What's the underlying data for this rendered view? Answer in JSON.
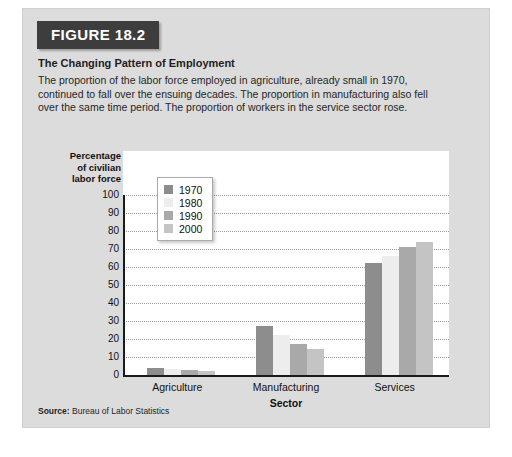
{
  "figure": {
    "badge": "FIGURE 18.2",
    "title": "The Changing Pattern of Employment",
    "description": "The proportion of the labor force employed in agriculture, already small in 1970, continued to fall over the ensuing decades. The proportion in manufacturing also fell over the same time period. The proportion of workers in the service sector rose.",
    "source_label": "Source:",
    "source_text": "Bureau of Labor Statistics"
  },
  "chart_data": {
    "type": "bar",
    "title": "The Changing Pattern of Employment",
    "xlabel": "Sector",
    "ylabel": "Percentage of civilian labor force",
    "ylabel_lines": [
      "Percentage",
      "of civilian",
      "labor force"
    ],
    "categories": [
      "Agriculture",
      "Manufacturing",
      "Services"
    ],
    "series": [
      {
        "name": "1970",
        "color": "#8d8d8d",
        "values": [
          4,
          27.5,
          62
        ]
      },
      {
        "name": "1980",
        "color": "#ededed",
        "values": [
          3.5,
          22,
          66
        ]
      },
      {
        "name": "1990",
        "color": "#a9a9a9",
        "values": [
          3,
          17.5,
          71
        ]
      },
      {
        "name": "2000",
        "color": "#c4c4c4",
        "values": [
          2.5,
          14.5,
          74
        ]
      }
    ],
    "ylim": [
      0,
      100
    ],
    "yticks": [
      0,
      10,
      20,
      30,
      40,
      50,
      60,
      70,
      80,
      90,
      100
    ],
    "ytick_labels": [
      "0",
      "10",
      "20",
      "30",
      "40",
      "50",
      "60",
      "70",
      "80",
      "90",
      "100"
    ],
    "grid": true,
    "grid_style": "dotted-horizontal",
    "legend_position": "upper-left-inside",
    "legend_entries": [
      "1970",
      "1980",
      "1990",
      "2000"
    ]
  }
}
